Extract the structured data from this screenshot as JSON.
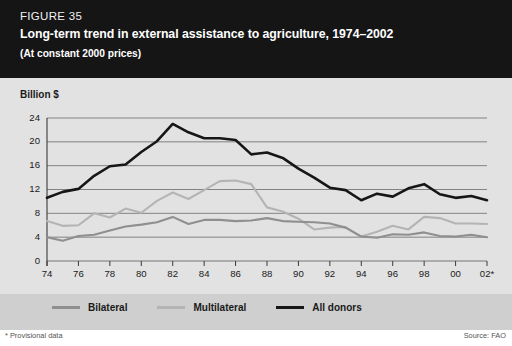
{
  "figure": {
    "number": "FIGURE 35",
    "title": "Long-term trend in external assistance to agriculture, 1974–2002",
    "subtitle": "(At constant 2000 prices)"
  },
  "footer": {
    "footnote": "* Provisional data",
    "source": "Source: FAO"
  },
  "legend": {
    "position": "bottom",
    "items": [
      {
        "label": "Bilateral",
        "color": "#8f8f8f"
      },
      {
        "label": "Multilateral",
        "color": "#b4b4b4"
      },
      {
        "label": "All donors",
        "color": "#161616"
      }
    ]
  },
  "colors": {
    "title_background": "#151515",
    "plot_background": "#e2e2e2",
    "legend_background": "#cfcfcf",
    "gridline": "#777777",
    "axis": "#3a3a3a",
    "bilateral": "#8f8f8f",
    "multilateral": "#b4b4b4",
    "all_donors": "#161616"
  },
  "chart_data": {
    "type": "line",
    "title": "Long-term trend in external assistance to agriculture, 1974–2002",
    "subtitle": "(At constant 2000 prices)",
    "xlabel": "",
    "ylabel": "Billion $",
    "ylim": [
      0,
      24
    ],
    "yticks": [
      0,
      4,
      8,
      12,
      16,
      20,
      24
    ],
    "xlim": [
      1974,
      2002
    ],
    "xticks": [
      1974,
      1976,
      1978,
      1980,
      1982,
      1984,
      1986,
      1988,
      1990,
      1992,
      1994,
      1996,
      1998,
      2000,
      2002
    ],
    "xtick_labels": [
      "74",
      "76",
      "78",
      "80",
      "82",
      "84",
      "86",
      "88",
      "90",
      "92",
      "94",
      "96",
      "98",
      "00",
      "02*"
    ],
    "grid": true,
    "legend_position": "bottom",
    "x": [
      1974,
      1975,
      1976,
      1977,
      1978,
      1979,
      1980,
      1981,
      1982,
      1983,
      1984,
      1985,
      1986,
      1987,
      1988,
      1989,
      1990,
      1991,
      1992,
      1993,
      1994,
      1995,
      1996,
      1997,
      1998,
      1999,
      2000,
      2001,
      2002
    ],
    "series": [
      {
        "name": "All donors",
        "color": "#161616",
        "values": [
          10.6,
          11.6,
          12.1,
          14.3,
          15.9,
          16.2,
          18.3,
          20.1,
          23.0,
          21.6,
          20.6,
          20.6,
          20.3,
          17.9,
          18.2,
          17.3,
          15.5,
          14.0,
          12.3,
          11.9,
          10.2,
          11.3,
          10.8,
          12.2,
          12.9,
          11.2,
          10.6,
          10.9,
          10.2
        ]
      },
      {
        "name": "Multilateral",
        "color": "#b4b4b4",
        "values": [
          6.7,
          5.9,
          6.0,
          8.0,
          7.3,
          8.8,
          8.1,
          10.1,
          11.5,
          10.4,
          11.9,
          13.4,
          13.5,
          12.9,
          9.0,
          8.3,
          7.1,
          5.3,
          5.6,
          5.7,
          4.1,
          4.9,
          5.9,
          5.3,
          7.4,
          7.2,
          6.3,
          6.3,
          6.2
        ]
      },
      {
        "name": "Bilateral",
        "color": "#8f8f8f",
        "values": [
          4.0,
          3.4,
          4.2,
          4.4,
          5.1,
          5.8,
          6.1,
          6.5,
          7.4,
          6.2,
          6.9,
          6.9,
          6.7,
          6.8,
          7.2,
          6.7,
          6.6,
          6.5,
          6.3,
          5.6,
          4.1,
          3.9,
          4.5,
          4.4,
          4.8,
          4.2,
          4.1,
          4.4,
          4.0
        ]
      }
    ]
  }
}
